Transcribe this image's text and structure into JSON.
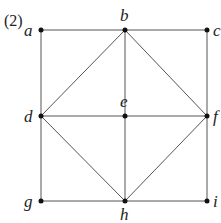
{
  "figure_label": "(2)",
  "nodes": [
    {
      "id": "a",
      "x": 41,
      "y": 30,
      "lx": 24,
      "ly": 36
    },
    {
      "id": "b",
      "x": 125,
      "y": 30,
      "lx": 120,
      "ly": 21
    },
    {
      "id": "c",
      "x": 207,
      "y": 30,
      "lx": 213,
      "ly": 36
    },
    {
      "id": "d",
      "x": 41,
      "y": 116,
      "lx": 24,
      "ly": 122
    },
    {
      "id": "e",
      "x": 125,
      "y": 116,
      "lx": 120,
      "ly": 107
    },
    {
      "id": "f",
      "x": 207,
      "y": 116,
      "lx": 213,
      "ly": 122
    },
    {
      "id": "g",
      "x": 41,
      "y": 201,
      "lx": 24,
      "ly": 207
    },
    {
      "id": "h",
      "x": 125,
      "y": 201,
      "lx": 120,
      "ly": 220
    },
    {
      "id": "i",
      "x": 207,
      "y": 201,
      "lx": 213,
      "ly": 207
    }
  ],
  "edges": [
    [
      "a",
      "b"
    ],
    [
      "b",
      "c"
    ],
    [
      "a",
      "d"
    ],
    [
      "b",
      "d"
    ],
    [
      "b",
      "e"
    ],
    [
      "b",
      "f"
    ],
    [
      "c",
      "f"
    ],
    [
      "d",
      "e"
    ],
    [
      "e",
      "f"
    ],
    [
      "d",
      "g"
    ],
    [
      "d",
      "h"
    ],
    [
      "e",
      "h"
    ],
    [
      "f",
      "h"
    ],
    [
      "f",
      "i"
    ],
    [
      "g",
      "h"
    ],
    [
      "h",
      "i"
    ]
  ]
}
